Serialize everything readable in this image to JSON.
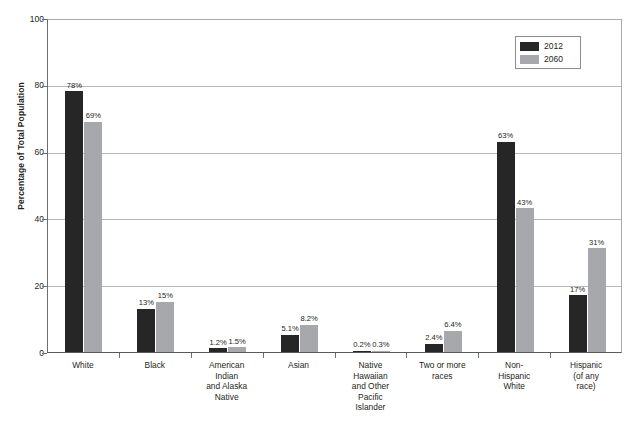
{
  "chart_data": {
    "type": "bar",
    "title": "",
    "xlabel": "",
    "ylabel": "Percentage of Total Population",
    "ylim": [
      0,
      100
    ],
    "yticks": [
      "0",
      "20",
      "40",
      "60",
      "80",
      "100"
    ],
    "grid": true,
    "legend_position": "top-right",
    "categories": [
      "White",
      "Black",
      "American Indian and Alaska Native",
      "Asian",
      "Native Hawaiian and Other Pacific Islander",
      "Two or more races",
      "Non-Hispanic White",
      "Hispanic (of any race)"
    ],
    "category_lines": [
      [
        "White"
      ],
      [
        "Black"
      ],
      [
        "American",
        "Indian",
        "and Alaska",
        "Native"
      ],
      [
        "Asian"
      ],
      [
        "Native",
        "Hawaiian",
        "and Other",
        "Pacific",
        "Islander"
      ],
      [
        "Two or more",
        "races"
      ],
      [
        "Non-",
        "Hispanic",
        "White"
      ],
      [
        "Hispanic",
        "(of any",
        "race)"
      ]
    ],
    "series": [
      {
        "name": "2012",
        "color": "#262626",
        "values": [
          78,
          13,
          1.2,
          5.1,
          0.2,
          2.4,
          63,
          17
        ],
        "labels": [
          "78%",
          "13%",
          "1.2%",
          "5.1%",
          "0.2%",
          "2.4%",
          "63%",
          "17%"
        ]
      },
      {
        "name": "2060",
        "color": "#a6a8ab",
        "values": [
          69,
          15,
          1.5,
          8.2,
          0.3,
          6.4,
          43,
          31
        ],
        "labels": [
          "69%",
          "15%",
          "1.5%",
          "8.2%",
          "0.3%",
          "6.4%",
          "43%",
          "31%"
        ]
      }
    ]
  },
  "legend": {
    "items": [
      {
        "label": "2012",
        "color": "#262626"
      },
      {
        "label": "2060",
        "color": "#a6a8ab"
      }
    ]
  },
  "axes": {
    "y_title": "Percentage of Total Population"
  }
}
